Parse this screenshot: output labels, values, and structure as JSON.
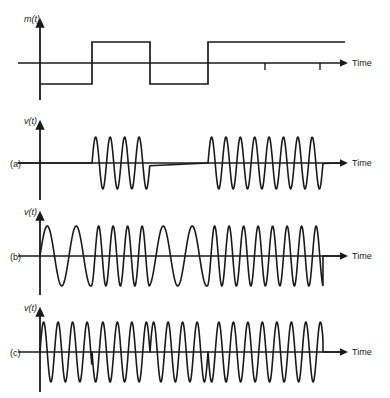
{
  "figure": {
    "background_color": "#ffffff",
    "stroke_color": "#1a1a1a",
    "line_width": 1.6
  },
  "panels": [
    {
      "id": "message",
      "panel_label": "",
      "y_axis_label": "m(t)",
      "x_axis_label": "Time",
      "waveform": "square-message",
      "description": "Binary message signal"
    },
    {
      "id": "ask",
      "panel_label": "(a)",
      "y_axis_label": "v(t)",
      "x_axis_label": "Time",
      "waveform": "ask-burst",
      "description": "Amplitude shift keying"
    },
    {
      "id": "fsk",
      "panel_label": "(b)",
      "y_axis_label": "v(t)",
      "x_axis_label": "Time",
      "waveform": "fsk",
      "description": "Frequency shift keying"
    },
    {
      "id": "psk",
      "panel_label": "(c)",
      "y_axis_label": "v(t)",
      "x_axis_label": "Time",
      "waveform": "psk",
      "description": "Phase shift keying"
    }
  ],
  "chart_data": {
    "type": "line",
    "xlabel": "Time",
    "ylabel": "m(t), v(t)",
    "grid": false,
    "legend": null,
    "x_domain": [
      40,
      323
    ],
    "bit_boundaries": [
      40,
      92,
      150,
      208,
      323
    ],
    "message_bits": [
      0,
      1,
      0,
      1
    ],
    "axis_ticks_message": [
      265,
      320
    ],
    "series": [
      {
        "name": "m(t)",
        "panel": "message",
        "type": "square",
        "baseline_y": 63,
        "high_y": 42,
        "low_y": 84,
        "segments": [
          {
            "x0": 40,
            "x1": 92,
            "level": "low"
          },
          {
            "x0": 92,
            "x1": 150,
            "level": "high"
          },
          {
            "x0": 150,
            "x1": 208,
            "level": "low"
          },
          {
            "x0": 208,
            "x1": 345,
            "level": "high"
          }
        ]
      },
      {
        "name": "v(t) ASK",
        "panel": "ask",
        "type": "sine-gated",
        "baseline_y": 163,
        "amplitude": 26,
        "cycle_width": 14.5,
        "bursts": [
          {
            "x0": 92,
            "x1": 150,
            "cycles": 4
          },
          {
            "x0": 208,
            "x1": 323,
            "cycles": 8
          }
        ]
      },
      {
        "name": "v(t) FSK",
        "panel": "fsk",
        "type": "sine-fsk",
        "baseline_y": 256,
        "amplitude": 30,
        "low_cycle_width": 29,
        "high_cycle_width": 14.5,
        "segments": [
          {
            "x0": 40,
            "x1": 92,
            "freq": "low"
          },
          {
            "x0": 92,
            "x1": 150,
            "freq": "high"
          },
          {
            "x0": 150,
            "x1": 208,
            "freq": "low"
          },
          {
            "x0": 208,
            "x1": 323,
            "freq": "high"
          }
        ]
      },
      {
        "name": "v(t) PSK",
        "panel": "psk",
        "type": "sine-psk",
        "baseline_y": 352,
        "amplitude": 30,
        "cycle_width": 14.5,
        "segments": [
          {
            "x0": 40,
            "x1": 92,
            "phase": 0
          },
          {
            "x0": 92,
            "x1": 150,
            "phase": 180
          },
          {
            "x0": 150,
            "x1": 208,
            "phase": 0
          },
          {
            "x0": 208,
            "x1": 323,
            "phase": 180
          }
        ]
      }
    ]
  }
}
